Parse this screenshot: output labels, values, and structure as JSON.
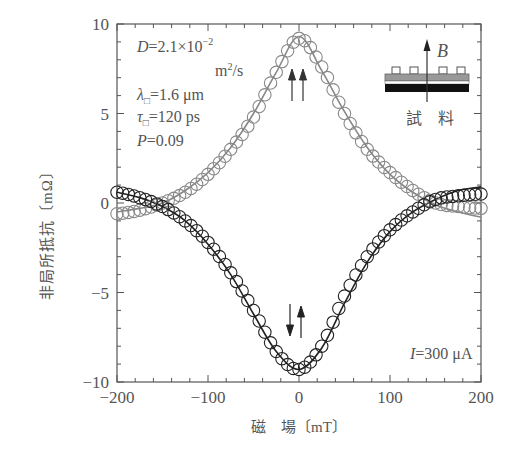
{
  "chart_data": {
    "type": "scatter",
    "title": "",
    "xlabel": "磁　場〔mT〕",
    "ylabel": "非局所抵抗〔mΩ〕",
    "xlim": [
      -200,
      200
    ],
    "ylim": [
      -10,
      10
    ],
    "xticks": [
      -200,
      -100,
      0,
      100,
      200
    ],
    "xtick_labels": [
      "−200",
      "−100",
      "0",
      "100",
      "200"
    ],
    "yticks": [
      -10,
      -5,
      0,
      5,
      10
    ],
    "ytick_labels": [
      "−10",
      "−5",
      "0",
      "5",
      "10"
    ],
    "grid": false,
    "x": [
      -200,
      -175,
      -150,
      -125,
      -100,
      -75,
      -50,
      -25,
      0,
      25,
      50,
      75,
      100,
      125,
      150,
      175,
      200
    ],
    "series": [
      {
        "name": "parallel (↑↑)",
        "marker": "open-circle",
        "color": "#888888",
        "values": [
          -0.6,
          -0.4,
          0.0,
          0.6,
          1.6,
          3.0,
          4.8,
          7.3,
          9.2,
          7.6,
          5.0,
          3.0,
          1.7,
          0.7,
          0.0,
          -0.2,
          -0.3
        ],
        "fit_values": [
          -0.5,
          -0.3,
          0.0,
          0.7,
          1.7,
          3.1,
          5.0,
          7.3,
          9.3,
          7.4,
          5.1,
          3.1,
          1.6,
          0.6,
          -0.1,
          -0.5,
          -0.8
        ]
      },
      {
        "name": "antiparallel (↓↑)",
        "marker": "open-circle",
        "color": "#222222",
        "values": [
          0.6,
          0.3,
          -0.2,
          -1.0,
          -2.2,
          -3.9,
          -6.0,
          -8.3,
          -9.3,
          -8.0,
          -5.2,
          -3.0,
          -1.5,
          -0.5,
          0.2,
          0.4,
          0.5
        ],
        "fit_values": [
          0.6,
          0.3,
          -0.2,
          -1.0,
          -2.3,
          -4.0,
          -6.2,
          -8.3,
          -9.3,
          -8.1,
          -5.6,
          -3.3,
          -1.6,
          -0.5,
          0.2,
          0.7,
          0.9
        ]
      }
    ],
    "annotations": {
      "params": [
        {
          "label": "D",
          "text": "D = 2.1 × 10⁻²"
        },
        {
          "label": "D-unit",
          "text": "m²/s"
        },
        {
          "label": "lambda",
          "text": "λ□ = 1.6 μm"
        },
        {
          "label": "tau",
          "text": "τ□ = 120 ps"
        },
        {
          "label": "P",
          "text": "P = 0.09"
        }
      ],
      "current": "I = 300 μA",
      "parallel_arrows": "↑↑",
      "antiparallel_arrows": "↓↑",
      "inset_field_label": "B",
      "inset_sample_label": "試　料"
    }
  }
}
